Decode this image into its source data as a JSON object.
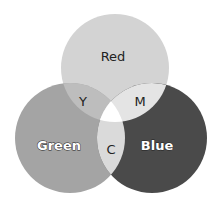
{
  "diagram": {
    "type": "venn-3",
    "title": "",
    "sets": [
      {
        "id": "red",
        "label": "Red",
        "cx": 115,
        "cy": 68,
        "r": 54,
        "fill": "#d3d3d3"
      },
      {
        "id": "green",
        "label": "Green",
        "cx": 70,
        "cy": 138,
        "r": 55,
        "fill": "#a4a4a4"
      },
      {
        "id": "blue",
        "label": "Blue",
        "cx": 152,
        "cy": 138,
        "r": 55,
        "fill": "#4a4a4a"
      }
    ],
    "intersections": [
      {
        "id": "yellow",
        "label": "Y",
        "sets": [
          "red",
          "green"
        ],
        "fill": "#bdbdbd"
      },
      {
        "id": "magenta",
        "label": "M",
        "sets": [
          "red",
          "blue"
        ],
        "fill": "#e4e4e4"
      },
      {
        "id": "cyan",
        "label": "C",
        "sets": [
          "green",
          "blue"
        ],
        "fill": "#dadada"
      },
      {
        "id": "white",
        "label": "",
        "sets": [
          "red",
          "green",
          "blue"
        ],
        "fill": "#ffffff"
      }
    ]
  }
}
